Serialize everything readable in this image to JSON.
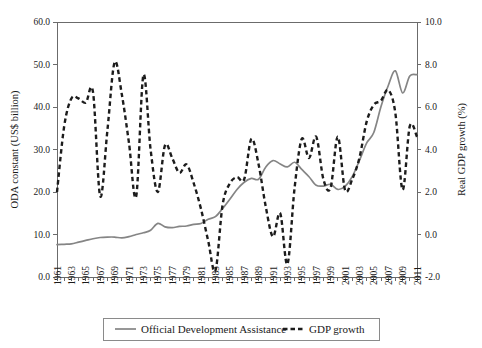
{
  "chart_data": {
    "type": "line",
    "title": "",
    "xlabel": "",
    "ylabel": "ODA constant (US$ billion)",
    "y2label": "Real GDP growth (%)",
    "grid": false,
    "legend_position": "bottom",
    "ylim": [
      0.0,
      60.0
    ],
    "y2lim": [
      -2.0,
      10.0
    ],
    "ytick_labels": [
      "0.0",
      "10.0",
      "20.0",
      "30.0",
      "40.0",
      "50.0",
      "60.0"
    ],
    "ytick_values": [
      0.0,
      10.0,
      20.0,
      30.0,
      40.0,
      50.0,
      60.0
    ],
    "y2tick_labels": [
      "-2.0",
      "0.0",
      "2.0",
      "4.0",
      "6.0",
      "8.0",
      "10.0"
    ],
    "y2tick_values": [
      -2.0,
      0.0,
      2.0,
      4.0,
      6.0,
      8.0,
      10.0
    ],
    "x": [
      1961,
      1962,
      1963,
      1964,
      1965,
      1966,
      1967,
      1968,
      1969,
      1970,
      1971,
      1972,
      1973,
      1974,
      1975,
      1976,
      1977,
      1978,
      1979,
      1980,
      1981,
      1982,
      1983,
      1984,
      1985,
      1986,
      1987,
      1988,
      1989,
      1990,
      1991,
      1992,
      1993,
      1994,
      1995,
      1996,
      1997,
      1998,
      1999,
      2000,
      2001,
      2002,
      2003,
      2004,
      2005,
      2006,
      2007,
      2008,
      2009,
      2010,
      2011
    ],
    "xtick_labels": [
      "1961",
      "1963",
      "1965",
      "1967",
      "1969",
      "1971",
      "1973",
      "1975",
      "1977",
      "1979",
      "1981",
      "1983",
      "1985",
      "1987",
      "1989",
      "1991",
      "1993",
      "1995",
      "1997",
      "1999",
      "2001",
      "2003",
      "2005",
      "2007",
      "2009",
      "2011"
    ],
    "series": [
      {
        "name": "Official Development Assistance",
        "axis": "left",
        "unit": "US$ billion",
        "style": "solid",
        "color": "#858585",
        "values": [
          7.6,
          7.7,
          7.8,
          8.2,
          8.6,
          9.0,
          9.3,
          9.4,
          9.4,
          9.2,
          9.5,
          10.0,
          10.4,
          11.0,
          12.6,
          11.8,
          11.6,
          11.9,
          12.0,
          12.4,
          12.6,
          13.6,
          14.2,
          16.1,
          18.3,
          20.6,
          22.3,
          23.2,
          23.0,
          25.9,
          27.4,
          26.6,
          25.9,
          27.0,
          25.3,
          23.6,
          21.6,
          21.4,
          21.8,
          20.6,
          21.3,
          23.6,
          27.4,
          31.5,
          34.0,
          40.1,
          45.0,
          48.5,
          43.3,
          47.3,
          47.6
        ]
      },
      {
        "name": "GDP growth",
        "axis": "right",
        "unit": "%",
        "style": "dashed",
        "color": "#1c1c1c",
        "values": [
          2.0,
          5.1,
          6.4,
          6.4,
          6.2,
          6.7,
          1.8,
          4.9,
          8.1,
          6.6,
          4.3,
          1.8,
          7.5,
          4.0,
          2.0,
          4.2,
          3.6,
          2.9,
          3.3,
          2.4,
          1.2,
          -0.3,
          -1.7,
          1.4,
          2.4,
          2.7,
          2.6,
          4.5,
          3.3,
          1.3,
          -0.1,
          1.0,
          -1.4,
          2.2,
          4.5,
          3.6,
          4.6,
          2.6,
          2.2,
          4.6,
          2.1,
          2.6,
          3.6,
          5.3,
          6.1,
          6.3,
          6.8,
          5.7,
          2.1,
          5.1,
          4.6
        ]
      }
    ]
  },
  "axes": {
    "left_title": "ODA constant (US$ billion)",
    "right_title": "Real GDP growth (%)"
  },
  "legend": {
    "items": [
      {
        "label": "Official Development Assistance",
        "style": "solid"
      },
      {
        "label": "GDP growth",
        "style": "dashed"
      }
    ]
  }
}
